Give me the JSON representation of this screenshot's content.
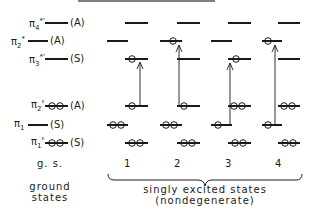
{
  "orbitals": [
    {
      "id": "pi4_star_prime",
      "label": "π4*'",
      "symmetry": "(A)"
    },
    {
      "id": "pi2_star",
      "label": "π2*",
      "symmetry": "(A)"
    },
    {
      "id": "pi3_star_prime",
      "label": "π3*'",
      "symmetry": "(S)"
    },
    {
      "id": "pi2_prime",
      "label": "π2'",
      "symmetry": "(A)"
    },
    {
      "id": "pi1",
      "label": "π1",
      "symmetry": "(S)"
    },
    {
      "id": "pi1_prime",
      "label": "π1'",
      "symmetry": "(S)"
    }
  ],
  "labels": {
    "pi4sp_sym": "(A)",
    "pi2s_sym": "(A)",
    "pi3sp_sym": "(S)",
    "pi2p_sym": "(A)",
    "pi1_sym": "(S)",
    "pi1p_sym": "(S)",
    "gs": "g. s.",
    "col1": "1",
    "col2": "2",
    "col3": "3",
    "col4": "4",
    "ground_caption_1": "ground",
    "ground_caption_2": "states",
    "excited_caption_1": "singly excited states",
    "excited_caption_2": "(nondegenerate)"
  },
  "excited_states": [
    {
      "n": 1,
      "transition": "π2' → π3*'"
    },
    {
      "n": 2,
      "transition": "π2' → π2*"
    },
    {
      "n": 3,
      "transition": "π1 → π3*'"
    },
    {
      "n": 4,
      "transition": "π1 → π2*"
    }
  ]
}
